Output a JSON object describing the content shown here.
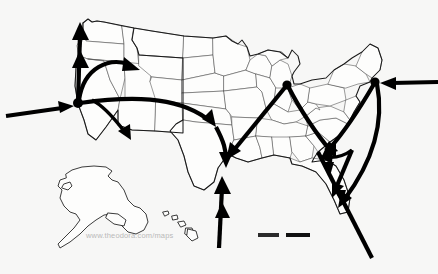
{
  "map": {
    "title": "United States migration and trade flow map",
    "region": "United States of America",
    "background_color": "#f7f7f6",
    "land_color": "#fdfdfc",
    "state_border_color": "#4a4a4a",
    "coast_border_color": "#1a1a1a",
    "flow_color": "#000000",
    "watermark": "www.theodora.com/maps",
    "scalebar": {
      "label": "",
      "segment_colors": [
        "#2b2b2b",
        "#111111"
      ]
    },
    "insets": [
      {
        "name": "alaska-inset",
        "label": ""
      },
      {
        "name": "hawaii-inset",
        "label": ""
      }
    ],
    "hubs": [
      {
        "name": "west-coast-hub",
        "label": "",
        "x": 78,
        "y": 103
      },
      {
        "name": "great-lakes-hub",
        "label": "",
        "x": 287,
        "y": 85
      },
      {
        "name": "northeast-hub",
        "label": "",
        "x": 375,
        "y": 82
      }
    ],
    "flows": [
      {
        "name": "pacific-inbound-flow",
        "from": "Pacific Ocean",
        "to": "West Coast",
        "direction": "east"
      },
      {
        "name": "atlantic-inbound-flow",
        "from": "Atlantic Ocean",
        "to": "Northeast",
        "direction": "west"
      },
      {
        "name": "west-coast-north-flow",
        "from": "West Coast",
        "to": "Pacific Northwest",
        "direction": "north"
      },
      {
        "name": "west-coast-northeast-flow",
        "from": "West Coast",
        "to": "Northern Rockies",
        "direction": "northeast"
      },
      {
        "name": "west-coast-east-flow",
        "from": "West Coast",
        "to": "Great Plains",
        "direction": "east"
      },
      {
        "name": "west-coast-southeast-flow",
        "from": "West Coast",
        "to": "Southwest",
        "direction": "southeast"
      },
      {
        "name": "great-lakes-southwest-flow",
        "from": "Great Lakes",
        "to": "South Central",
        "direction": "southwest"
      },
      {
        "name": "great-lakes-southeast-flow",
        "from": "Great Lakes",
        "to": "Southeast",
        "direction": "southeast"
      },
      {
        "name": "gulf-inbound-flow",
        "from": "Gulf of Mexico",
        "to": "South Central",
        "direction": "north"
      },
      {
        "name": "northeast-southwest-flow",
        "from": "Northeast",
        "to": "Southeast Interior",
        "direction": "southwest"
      },
      {
        "name": "northeast-south-flow",
        "from": "Northeast",
        "to": "Florida",
        "direction": "south"
      },
      {
        "name": "southeast-caribbean-flow",
        "from": "Southeast",
        "to": "Caribbean",
        "direction": "southeast"
      }
    ]
  }
}
